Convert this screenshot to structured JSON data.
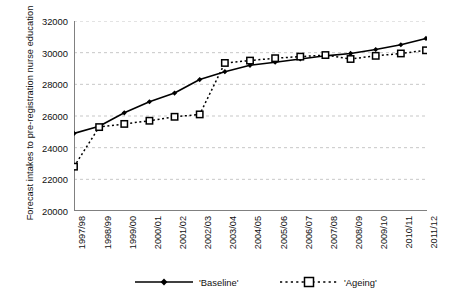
{
  "chart_data": {
    "type": "line",
    "title": "",
    "xlabel": "",
    "ylabel": "Forecast intakes to pre-registration nurse education",
    "categories": [
      "1997/98",
      "1998/99",
      "1999/00",
      "2000/01",
      "2001/02",
      "2002/03",
      "2003/04",
      "2004/05",
      "2005/06",
      "2006/07",
      "2007/08",
      "2008/09",
      "2009/10",
      "2010/11",
      "2011/12"
    ],
    "ylim": [
      20000,
      32000
    ],
    "ytick_step": 2000,
    "yticks": [
      20000,
      22000,
      24000,
      26000,
      28000,
      30000,
      32000
    ],
    "ytick_labels": [
      "20000",
      "22000",
      "24000",
      "26000",
      "28000",
      "30000",
      "32000"
    ],
    "grid": true,
    "grid_style": "dashed-horizontal",
    "legend_position": "bottom",
    "series": [
      {
        "name": "'Baseline'",
        "marker": "filled-diamond",
        "line_style": "solid",
        "color": "#000000",
        "values": [
          24900,
          25350,
          26200,
          26900,
          27450,
          28300,
          28800,
          29200,
          29400,
          29600,
          29800,
          29950,
          30200,
          30500,
          30900
        ]
      },
      {
        "name": "'Ageing'",
        "marker": "open-square",
        "line_style": "dotted",
        "color": "#000000",
        "values": [
          22800,
          25300,
          25500,
          25700,
          25950,
          26100,
          29350,
          29500,
          29650,
          29750,
          29850,
          29600,
          29800,
          29950,
          30150
        ]
      }
    ]
  },
  "legend": {
    "baseline_label": "'Baseline'",
    "ageing_label": "'Ageing'"
  },
  "colors": {
    "axis": "#808080",
    "grid": "#b0b0b0",
    "series": "#000000",
    "background": "#ffffff"
  }
}
